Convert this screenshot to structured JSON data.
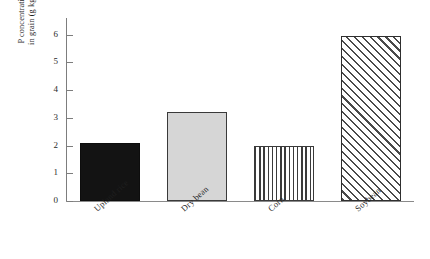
{
  "chart_data": {
    "type": "bar",
    "title": "",
    "subtitle": "",
    "xlabel": "",
    "ylabel_line1": "P concentration",
    "ylabel_line2": "in grain (g kg",
    "ylabel_superscript": "−1",
    "ylabel_line2_tail": ")",
    "ylabel_full": "P concentration in grain (g kg−1)",
    "categories": [
      "Upland rice",
      "Dry bean",
      "Corn",
      "Soybean"
    ],
    "values": [
      2.1,
      3.2,
      2.0,
      5.95
    ],
    "ylim": [
      0,
      6.6
    ],
    "yticks": [
      0,
      1,
      2,
      3,
      4,
      5,
      6
    ],
    "ytick_labels": [
      "0",
      "1",
      "2",
      "3",
      "4",
      "5",
      "6"
    ],
    "grid": false,
    "legend": false,
    "legend_position": "none",
    "bar_styles": [
      "solid-black",
      "light-gray",
      "vertical-stripes",
      "diagonal-hatch"
    ],
    "colors": {
      "axis": "#7d7d7d",
      "baseline": "#8a8a8a",
      "text": "#1f1f1f",
      "bar_black_fill": "#131313",
      "bar_gray_fill": "#d6d6d6",
      "bar_hatch_line": "#4a4a4a",
      "bar_stripe_line": "#3b3b3b",
      "bar_border": "#3a3a3a",
      "background": "#ffffff"
    }
  }
}
